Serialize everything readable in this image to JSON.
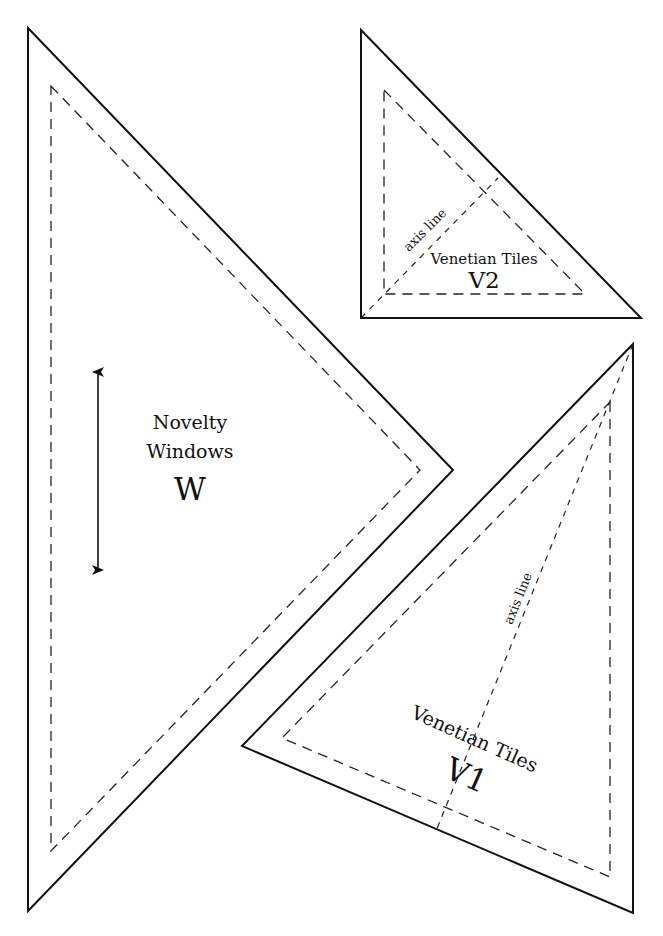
{
  "page": {
    "background": "#ffffff",
    "line_color": "#111111"
  },
  "pieces": {
    "w": {
      "name_line1": "Novelty",
      "name_line2": "Windows",
      "code": "W",
      "grain_indicator": "double-arrow"
    },
    "v2": {
      "name": "Venetian Tiles",
      "code": "V2",
      "axis_label": "axis line"
    },
    "v1": {
      "name": "Venetian Tiles",
      "code": "V1",
      "axis_label": "axis line"
    }
  },
  "legend": {
    "solid_line": "cutting line",
    "dashed_line": "seam line"
  }
}
